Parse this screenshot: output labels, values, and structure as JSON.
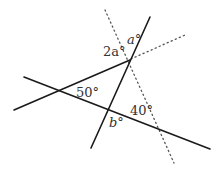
{
  "diagram": {
    "title": "",
    "labels": {
      "a": "a°",
      "two_a": "2a°",
      "fifty": "50°",
      "b": "b°",
      "forty": "40°"
    },
    "colors": {
      "line": "#1a1a1a",
      "dotted": "#555555",
      "text": "#333333",
      "background": "#ffffff"
    },
    "lines": [
      {
        "id": "steep-line",
        "style": "solid",
        "from": [
          150,
          17
        ],
        "to": [
          91,
          148
        ]
      },
      {
        "id": "rising-line",
        "style": "solid",
        "from": [
          14,
          110
        ],
        "to": [
          130,
          60
        ]
      },
      {
        "id": "falling-line",
        "style": "solid",
        "from": [
          24,
          77
        ],
        "to": [
          210,
          149
        ]
      },
      {
        "id": "dotted-line-steep",
        "style": "dotted",
        "from": [
          105,
          10
        ],
        "to": [
          174,
          163
        ]
      },
      {
        "id": "dotted-line-shallow",
        "style": "dotted",
        "from": [
          130,
          60
        ],
        "to": [
          185,
          35
        ]
      }
    ]
  }
}
